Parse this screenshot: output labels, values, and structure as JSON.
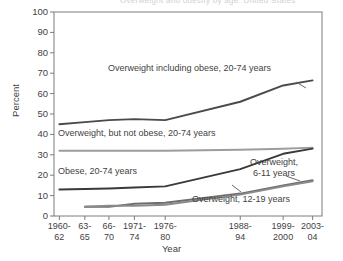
{
  "figure": {
    "cut_off_title": "Overweight and obesity by age: United States",
    "background": "#ffffff",
    "ink_color": "#3f3f3f"
  },
  "axes": {
    "ylabel": "Percent",
    "xlabel": "Year",
    "yticks": [
      "100",
      "90",
      "80",
      "70",
      "60",
      "50",
      "40",
      "30",
      "20",
      "10",
      "0"
    ],
    "xticks": [
      "1960-\n62",
      "63-\n65",
      "66-\n70",
      "1971-\n74",
      "1976-\n80",
      "1988-\n94",
      "1999-\n2000",
      "2003-\n04"
    ]
  },
  "annotations": {
    "overweight_including_obese": "Overweight including obese, 20-74 years",
    "overweight_not_obese": "Overweight, but not obese, 20-74 years",
    "obese_adults": "Obese, 20-74 years",
    "overweight_6_11": "Overweight,\n6-11 years",
    "overweight_12_19": "Overweight, 12-19 years"
  },
  "chart_data": {
    "type": "line",
    "title": "Overweight and obesity by age: United States",
    "xlabel": "Year",
    "ylabel": "Percent",
    "ylim": [
      0,
      100
    ],
    "ytick_step": 10,
    "grid": false,
    "legend": "inline-annotations",
    "categories": [
      "1960-62",
      "63-65",
      "66-70",
      "1971-74",
      "1976-80",
      "1988-94",
      "1999-2000",
      "2003-04"
    ],
    "series": [
      {
        "name": "Overweight including obese, 20-74 years",
        "color": "#4a4a4a",
        "values": [
          45,
          46,
          47,
          47.5,
          47,
          56,
          64,
          66.5
        ]
      },
      {
        "name": "Overweight, but not obese, 20-74 years",
        "color": "#9d9d9d",
        "values": [
          32,
          32,
          32,
          32,
          32,
          32.5,
          33,
          33.5
        ]
      },
      {
        "name": "Obese, 20-74 years",
        "color": "#3a3a3a",
        "values": [
          13,
          13.2,
          13.5,
          14,
          14.5,
          23,
          30.5,
          33
        ]
      },
      {
        "name": "Overweight, 6-11 years",
        "color": "#6e6e6e",
        "values": [
          null,
          4.5,
          4.5,
          6,
          6.5,
          11,
          15,
          17.5
        ]
      },
      {
        "name": "Overweight, 12-19 years",
        "color": "#8a8a8a",
        "values": [
          null,
          4.5,
          5,
          5,
          5.5,
          10.5,
          14.5,
          17
        ]
      }
    ]
  }
}
